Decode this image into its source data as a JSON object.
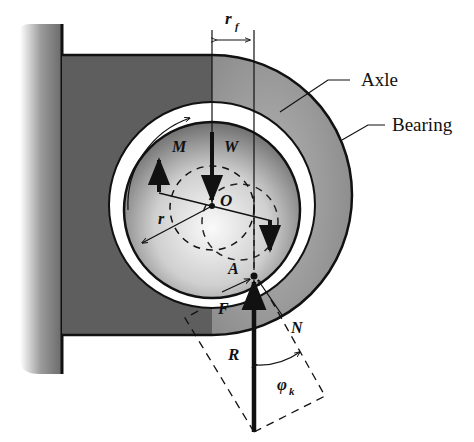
{
  "figure": {
    "labels": {
      "axle": "Axle",
      "bearing": "Bearing",
      "r_f": "r",
      "r_f_sub": "f",
      "M": "M",
      "W": "W",
      "O": "O",
      "r": "r",
      "A": "A",
      "F": "F",
      "R": "R",
      "N": "N",
      "phi": "φ",
      "phi_sub": "k"
    },
    "colors": {
      "support": "#8a8a8a",
      "bracket": "#5a5a5a",
      "bearing_ring": "#9a9a9a",
      "axle_light": "#f2f2f2",
      "axle_dark": "#7a7a7a",
      "ink": "#111111"
    }
  }
}
